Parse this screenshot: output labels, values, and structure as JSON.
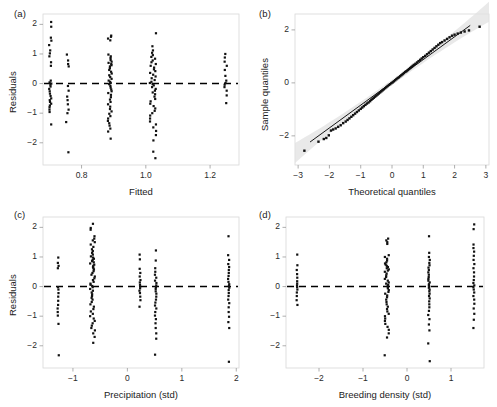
{
  "figure": {
    "background": "#ffffff",
    "point_color": "#111111",
    "line_color": "#000000",
    "band_color": "#e2e2e2",
    "frame_color": "#d8d8d8",
    "width": 497,
    "height": 407
  },
  "panels": [
    {
      "tag": "(a)",
      "id": "panel-a",
      "chart_index": 0
    },
    {
      "tag": "(b)",
      "id": "panel-b",
      "chart_index": 1
    },
    {
      "tag": "(c)",
      "id": "panel-c",
      "chart_index": 2
    },
    {
      "tag": "(d)",
      "id": "panel-d",
      "chart_index": 3
    }
  ],
  "chart_data": [
    {
      "type": "scatter",
      "panel": "(a)",
      "title": "",
      "xlabel": "Fitted",
      "ylabel": "Residuals",
      "xlim": [
        0.68,
        1.29
      ],
      "ylim": [
        -2.75,
        2.35
      ],
      "xticks": [
        0.8,
        1.0,
        1.2
      ],
      "xticklabels": [
        "0.8",
        "1.0",
        "1.2"
      ],
      "yticks": [
        2,
        1,
        0,
        -1,
        -2
      ],
      "yticklabels": [
        "2",
        "1",
        "0",
        "-1",
        "-2"
      ],
      "grid": false,
      "reference_line": {
        "orientation": "horizontal",
        "y": 0,
        "style": "dashed"
      },
      "clusters": [
        {
          "x": 0.703,
          "jitter": 0.004,
          "y": [
            2.08,
            1.92,
            1.55,
            1.45,
            1.3,
            1.12,
            1.02,
            0.92,
            0.72,
            0.6,
            0.1,
            0.04,
            0.0,
            -0.04,
            -0.1,
            -0.18,
            -0.26,
            -0.34,
            -0.42,
            -0.5,
            -0.56,
            -0.62,
            -0.68,
            -0.74,
            -0.8,
            -0.88,
            -0.96,
            -1.38
          ]
        },
        {
          "x": 0.756,
          "jitter": 0.004,
          "y": [
            0.98,
            0.78,
            0.66,
            0.58,
            -0.08,
            -0.24,
            -0.44,
            -0.56,
            -0.7,
            -0.88,
            -1.0,
            -1.3,
            -2.32
          ]
        },
        {
          "x": 0.888,
          "jitter": 0.006,
          "y": [
            1.62,
            1.58,
            1.52,
            1.46,
            0.98,
            0.92,
            0.86,
            0.8,
            0.74,
            0.7,
            0.66,
            0.62,
            0.58,
            0.52,
            0.46,
            0.4,
            0.34,
            0.28,
            0.22,
            0.16,
            0.1,
            0.06,
            0.02,
            -0.02,
            -0.08,
            -0.14,
            -0.2,
            -0.26,
            -0.32,
            -0.38,
            -0.46,
            -0.54,
            -0.62,
            -0.7,
            -0.78,
            -0.86,
            -0.94,
            -1.02,
            -1.1,
            -1.18,
            -1.26,
            -1.34,
            -1.42,
            -1.52,
            -1.62,
            -1.86
          ]
        },
        {
          "x": 1.022,
          "jitter": 0.01,
          "y": [
            1.7,
            1.26,
            1.12,
            1.04,
            0.96,
            0.9,
            0.84,
            0.78,
            0.72,
            0.66,
            0.6,
            0.54,
            0.48,
            0.42,
            0.36,
            0.3,
            0.24,
            0.18,
            0.12,
            0.06,
            0.02,
            -0.02,
            -0.06,
            -0.12,
            -0.18,
            -0.24,
            -0.3,
            -0.36,
            -0.44,
            -0.52,
            -0.6,
            -0.68,
            -0.76,
            -0.84,
            -0.92,
            -1.0,
            -1.08,
            -1.18,
            -1.28,
            -1.38,
            -1.48,
            -1.6,
            -1.74,
            -1.92,
            -2.3,
            -2.52
          ]
        },
        {
          "x": 1.248,
          "jitter": 0.004,
          "y": [
            1.0,
            0.88,
            0.74,
            0.6,
            0.46,
            0.26,
            0.1,
            0.02,
            -0.04,
            -0.12,
            -0.24,
            -0.4,
            -0.66
          ]
        }
      ]
    },
    {
      "type": "scatter",
      "panel": "(b)",
      "title": "",
      "xlabel": "Theoretical quantiles",
      "ylabel": "Sample quantiles",
      "xlim": [
        -3.1,
        3.1
      ],
      "ylim": [
        -3.1,
        2.6
      ],
      "xticks": [
        -3,
        -2,
        -1,
        0,
        1,
        2,
        3
      ],
      "xticklabels": [
        "-3",
        "-2",
        "-1",
        "0",
        "1",
        "2",
        "3"
      ],
      "yticks": [
        2,
        0,
        -2
      ],
      "yticklabels": [
        "2",
        "0",
        "-2"
      ],
      "grid": false,
      "reference_line": {
        "orientation": "diagonal",
        "slope": 0.86,
        "intercept": 0.02,
        "style": "solid"
      },
      "confidence_band": {
        "visible": true,
        "label": "pointwise band"
      },
      "qq_points": [
        [
          -2.8,
          -2.56
        ],
        [
          -2.35,
          -2.22
        ],
        [
          -2.18,
          -2.12
        ],
        [
          -2.1,
          -2.08
        ],
        [
          -2.02,
          -1.98
        ],
        [
          -1.95,
          -1.8
        ],
        [
          -1.88,
          -1.76
        ],
        [
          -1.8,
          -1.72
        ],
        [
          -1.72,
          -1.66
        ],
        [
          -1.64,
          -1.6
        ],
        [
          -1.56,
          -1.52
        ],
        [
          -1.48,
          -1.46
        ],
        [
          -1.42,
          -1.4
        ],
        [
          -1.36,
          -1.34
        ],
        [
          -1.3,
          -1.28
        ],
        [
          -1.24,
          -1.22
        ],
        [
          -1.18,
          -1.16
        ],
        [
          -1.12,
          -1.1
        ],
        [
          -1.06,
          -1.04
        ],
        [
          -1.0,
          -0.98
        ],
        [
          -0.95,
          -0.93
        ],
        [
          -0.9,
          -0.88
        ],
        [
          -0.85,
          -0.83
        ],
        [
          -0.8,
          -0.78
        ],
        [
          -0.75,
          -0.74
        ],
        [
          -0.7,
          -0.69
        ],
        [
          -0.66,
          -0.64
        ],
        [
          -0.62,
          -0.6
        ],
        [
          -0.58,
          -0.56
        ],
        [
          -0.54,
          -0.52
        ],
        [
          -0.5,
          -0.48
        ],
        [
          -0.46,
          -0.44
        ],
        [
          -0.42,
          -0.4
        ],
        [
          -0.38,
          -0.36
        ],
        [
          -0.34,
          -0.32
        ],
        [
          -0.3,
          -0.28
        ],
        [
          -0.26,
          -0.24
        ],
        [
          -0.22,
          -0.2
        ],
        [
          -0.18,
          -0.16
        ],
        [
          -0.14,
          -0.12
        ],
        [
          -0.1,
          -0.08
        ],
        [
          -0.06,
          -0.05
        ],
        [
          -0.02,
          -0.01
        ],
        [
          0.02,
          0.02
        ],
        [
          0.06,
          0.06
        ],
        [
          0.1,
          0.1
        ],
        [
          0.14,
          0.14
        ],
        [
          0.18,
          0.18
        ],
        [
          0.22,
          0.21
        ],
        [
          0.26,
          0.25
        ],
        [
          0.3,
          0.29
        ],
        [
          0.34,
          0.33
        ],
        [
          0.38,
          0.37
        ],
        [
          0.42,
          0.41
        ],
        [
          0.46,
          0.44
        ],
        [
          0.5,
          0.48
        ],
        [
          0.54,
          0.52
        ],
        [
          0.58,
          0.56
        ],
        [
          0.62,
          0.6
        ],
        [
          0.66,
          0.64
        ],
        [
          0.7,
          0.68
        ],
        [
          0.75,
          0.72
        ],
        [
          0.8,
          0.77
        ],
        [
          0.85,
          0.82
        ],
        [
          0.9,
          0.87
        ],
        [
          0.95,
          0.92
        ],
        [
          1.0,
          0.97
        ],
        [
          1.06,
          1.02
        ],
        [
          1.12,
          1.08
        ],
        [
          1.18,
          1.14
        ],
        [
          1.24,
          1.2
        ],
        [
          1.3,
          1.26
        ],
        [
          1.36,
          1.32
        ],
        [
          1.42,
          1.38
        ],
        [
          1.48,
          1.44
        ],
        [
          1.54,
          1.5
        ],
        [
          1.6,
          1.54
        ],
        [
          1.68,
          1.6
        ],
        [
          1.76,
          1.66
        ],
        [
          1.84,
          1.72
        ],
        [
          1.92,
          1.78
        ],
        [
          2.0,
          1.82
        ],
        [
          2.1,
          1.86
        ],
        [
          2.2,
          1.9
        ],
        [
          2.32,
          1.94
        ],
        [
          2.46,
          1.98
        ],
        [
          2.8,
          2.12
        ]
      ]
    },
    {
      "type": "scatter",
      "panel": "(c)",
      "title": "",
      "xlabel": "Precipitation (std)",
      "ylabel": "Residuals",
      "xlim": [
        -1.55,
        2.05
      ],
      "ylim": [
        -2.75,
        2.35
      ],
      "xticks": [
        -1,
        0,
        1,
        2
      ],
      "xticklabels": [
        "-1",
        "0",
        "1",
        "2"
      ],
      "yticks": [
        2,
        1,
        0,
        -1,
        -2
      ],
      "yticklabels": [
        "2",
        "1",
        "0",
        "-1",
        "-2"
      ],
      "grid": false,
      "reference_line": {
        "orientation": "horizontal",
        "y": 0,
        "style": "dashed"
      },
      "clusters": [
        {
          "x": -1.27,
          "jitter": 0.012,
          "y": [
            0.98,
            0.8,
            0.7,
            0.62,
            -0.02,
            -0.1,
            -0.22,
            -0.34,
            -0.48,
            -0.62,
            -0.74,
            -0.86,
            -0.98,
            -1.26,
            -2.32
          ]
        },
        {
          "x": -0.64,
          "jitter": 0.045,
          "y": [
            2.12,
            1.98,
            1.92,
            1.7,
            1.62,
            1.56,
            1.5,
            1.42,
            1.34,
            1.26,
            1.2,
            1.14,
            1.08,
            1.02,
            0.98,
            0.94,
            0.9,
            0.86,
            0.82,
            0.78,
            0.74,
            0.7,
            0.66,
            0.62,
            0.58,
            0.52,
            0.46,
            0.4,
            0.34,
            0.28,
            0.22,
            0.16,
            0.1,
            0.06,
            0.02,
            -0.02,
            -0.08,
            -0.14,
            -0.2,
            -0.26,
            -0.32,
            -0.38,
            -0.44,
            -0.52,
            -0.6,
            -0.68,
            -0.76,
            -0.84,
            -0.92,
            -1.0,
            -1.08,
            -1.16,
            -1.24,
            -1.32,
            -1.4,
            -1.48,
            -1.58,
            -1.7,
            -1.9
          ]
        },
        {
          "x": 0.23,
          "jitter": 0.01,
          "y": [
            1.08,
            0.92,
            0.6,
            0.46,
            0.34,
            0.22,
            0.14,
            0.06,
            0.0,
            -0.06,
            -0.14,
            -0.22,
            -0.34,
            -0.46,
            -0.68
          ]
        },
        {
          "x": 0.52,
          "jitter": 0.014,
          "y": [
            1.22,
            0.88,
            0.62,
            0.5,
            0.4,
            0.3,
            0.2,
            0.12,
            0.04,
            -0.02,
            -0.08,
            -0.16,
            -0.24,
            -0.34,
            -0.44,
            -0.54,
            -0.64,
            -0.74,
            -0.86,
            -0.98,
            -1.1,
            -1.24,
            -1.4,
            -1.58,
            -1.76,
            -2.3
          ]
        },
        {
          "x": 1.86,
          "jitter": 0.012,
          "y": [
            1.7,
            1.06,
            0.9,
            0.76,
            0.66,
            0.56,
            0.46,
            0.36,
            0.26,
            0.16,
            0.08,
            0.02,
            -0.04,
            -0.12,
            -0.22,
            -0.32,
            -0.44,
            -0.56,
            -0.7,
            -0.86,
            -1.02,
            -1.2,
            -1.4,
            -2.54
          ]
        }
      ]
    },
    {
      "type": "scatter",
      "panel": "(d)",
      "title": "",
      "xlabel": "Breeding density (std)",
      "ylabel": "",
      "xlim": [
        -2.75,
        1.75
      ],
      "ylim": [
        -2.75,
        2.35
      ],
      "xticks": [
        -2,
        -1,
        0,
        1
      ],
      "xticklabels": [
        "-2",
        "-1",
        "0",
        "1"
      ],
      "yticks": [
        2,
        1,
        0,
        -1,
        -2
      ],
      "yticklabels": [
        "2",
        "1",
        "0",
        "-1",
        "-2"
      ],
      "grid": false,
      "reference_line": {
        "orientation": "horizontal",
        "y": 0,
        "style": "dashed"
      },
      "clusters": [
        {
          "x": -2.5,
          "jitter": 0.01,
          "y": [
            1.08,
            0.72,
            0.56,
            0.42,
            0.3,
            0.18,
            0.1,
            0.04,
            -0.02,
            -0.1,
            -0.2,
            -0.32,
            -0.46,
            -0.62
          ]
        },
        {
          "x": -0.46,
          "jitter": 0.048,
          "y": [
            1.62,
            1.56,
            1.5,
            1.44,
            1.06,
            1.0,
            0.94,
            0.88,
            0.82,
            0.78,
            0.74,
            0.7,
            0.66,
            0.62,
            0.58,
            0.54,
            0.5,
            0.44,
            0.38,
            0.32,
            0.26,
            0.2,
            0.14,
            0.1,
            0.06,
            0.02,
            -0.02,
            -0.06,
            -0.12,
            -0.18,
            -0.24,
            -0.3,
            -0.36,
            -0.44,
            -0.52,
            -0.6,
            -0.68,
            -0.76,
            -0.84,
            -0.92,
            -1.0,
            -1.08,
            -1.16,
            -1.26,
            -1.36,
            -1.46,
            -1.58,
            -1.72,
            -2.32
          ]
        },
        {
          "x": 0.5,
          "jitter": 0.018,
          "y": [
            1.7,
            1.14,
            1.0,
            0.9,
            0.8,
            0.72,
            0.64,
            0.56,
            0.48,
            0.4,
            0.32,
            0.26,
            0.2,
            0.14,
            0.08,
            0.04,
            0.0,
            -0.04,
            -0.1,
            -0.16,
            -0.24,
            -0.32,
            -0.4,
            -0.5,
            -0.6,
            -0.7,
            -0.82,
            -0.96,
            -1.1,
            -1.28,
            -1.48,
            -1.92,
            -2.52
          ]
        },
        {
          "x": 1.52,
          "jitter": 0.012,
          "y": [
            2.1,
            1.94,
            1.42,
            1.3,
            1.18,
            1.04,
            0.9,
            0.76,
            0.62,
            0.48,
            0.34,
            0.22,
            0.12,
            0.04,
            -0.02,
            -0.1,
            -0.2,
            -0.32,
            -0.44,
            -0.58,
            -0.74,
            -0.92,
            -1.12,
            -1.4
          ]
        }
      ]
    }
  ]
}
